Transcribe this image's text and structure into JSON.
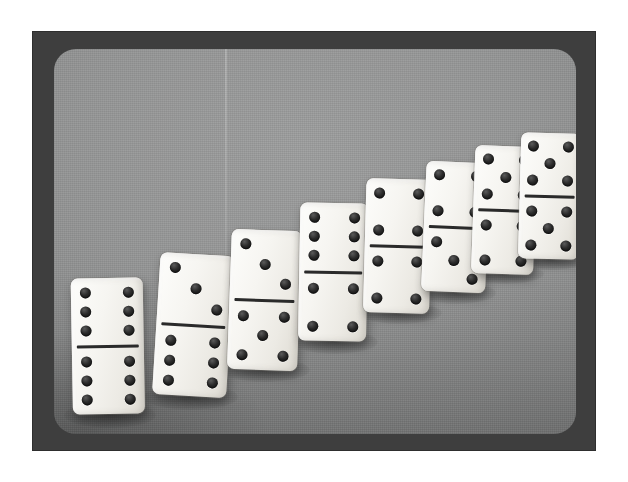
{
  "scene": {
    "title": "Row of eight standing dominoes",
    "subject": "dominoes",
    "count": 8,
    "orientation": "upright standing tiles arranged in an ascending left-to-right diagonal",
    "medium": "black-and-white halftone photograph",
    "colors": {
      "page_background": "#ffffff",
      "frame": "#3e3e3e",
      "backdrop_light": "#9fa0a0",
      "backdrop_dark": "#7d7e7e",
      "tile_face": "#f6f5f1",
      "pip": "#1b1b1b",
      "divider_bar": "#2a2a2a"
    }
  },
  "dominoes": [
    {
      "index": 1,
      "label": "6-6",
      "top": 6,
      "bottom": 6,
      "total": 12,
      "x": 73,
      "y": 278,
      "w": 72,
      "h": 136,
      "rotate": -1.0,
      "scale": 1.0,
      "z": 1,
      "shadow": {
        "x": 64,
        "y": 402,
        "w": 92,
        "h": 26
      }
    },
    {
      "index": 2,
      "label": "3-6",
      "top": 3,
      "bottom": 6,
      "total": 9,
      "x": 152,
      "y": 254,
      "w": 74,
      "h": 142,
      "rotate": 3.5,
      "scale": 1.0,
      "z": 2,
      "shadow": {
        "x": 144,
        "y": 384,
        "w": 94,
        "h": 26
      }
    },
    {
      "index": 3,
      "label": "3-5",
      "top": 3,
      "bottom": 5,
      "total": 8,
      "x": 227,
      "y": 230,
      "w": 70,
      "h": 140,
      "rotate": 2.0,
      "scale": 1.0,
      "z": 3,
      "shadow": {
        "x": 220,
        "y": 358,
        "w": 90,
        "h": 24
      }
    },
    {
      "index": 4,
      "label": "6-4",
      "top": 6,
      "bottom": 4,
      "total": 10,
      "x": 298,
      "y": 203,
      "w": 68,
      "h": 138,
      "rotate": 1.0,
      "scale": 1.0,
      "z": 4,
      "shadow": {
        "x": 292,
        "y": 330,
        "w": 86,
        "h": 24
      }
    },
    {
      "index": 5,
      "label": "4-4",
      "top": 4,
      "bottom": 4,
      "total": 8,
      "x": 363,
      "y": 179,
      "w": 66,
      "h": 134,
      "rotate": 1.5,
      "scale": 1.0,
      "z": 5,
      "shadow": {
        "x": 358,
        "y": 302,
        "w": 84,
        "h": 22
      }
    },
    {
      "index": 6,
      "label": "4-3",
      "top": 4,
      "bottom": 3,
      "total": 7,
      "x": 421,
      "y": 162,
      "w": 64,
      "h": 130,
      "rotate": 2.5,
      "scale": 1.0,
      "z": 6,
      "shadow": {
        "x": 416,
        "y": 282,
        "w": 80,
        "h": 22
      }
    },
    {
      "index": 7,
      "label": "5-4",
      "top": 5,
      "bottom": 4,
      "total": 9,
      "x": 471,
      "y": 146,
      "w": 62,
      "h": 128,
      "rotate": 2.0,
      "scale": 1.0,
      "z": 7,
      "shadow": {
        "x": 466,
        "y": 264,
        "w": 78,
        "h": 20
      }
    },
    {
      "index": 8,
      "label": "5-5",
      "top": 5,
      "bottom": 5,
      "total": 10,
      "x": 518,
      "y": 133,
      "w": 60,
      "h": 126,
      "rotate": 1.5,
      "scale": 1.0,
      "z": 8,
      "shadow": {
        "x": 514,
        "y": 250,
        "w": 74,
        "h": 20
      }
    }
  ]
}
